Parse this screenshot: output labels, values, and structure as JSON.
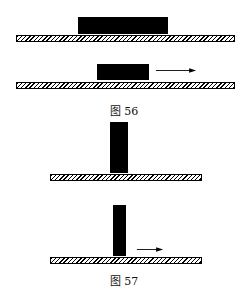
{
  "figures": [
    {
      "caption": "图 56",
      "panels": [
        {
          "block": "wide-block-at-rest",
          "arrow": false
        },
        {
          "block": "wide-block-moving-right",
          "arrow": true
        }
      ]
    },
    {
      "caption": "图 57",
      "panels": [
        {
          "block": "tall-block-at-rest",
          "arrow": false
        },
        {
          "block": "tall-block-moving-right",
          "arrow": true
        }
      ]
    }
  ]
}
